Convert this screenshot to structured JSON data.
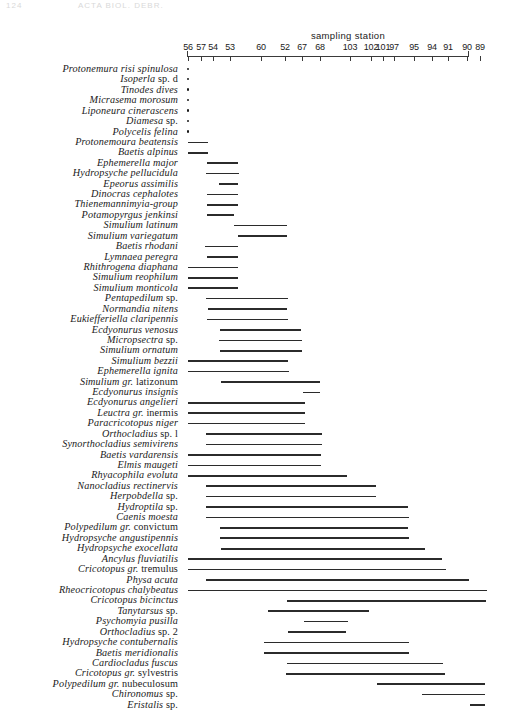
{
  "page_header": {
    "number": "124",
    "title": "ACTA BIOL. DEBR."
  },
  "axis": {
    "title": "sampling station",
    "x_left_px": 187,
    "x_right_px": 468,
    "ticks": [
      {
        "label": "56",
        "x": 188
      },
      {
        "label": "57",
        "x": 201
      },
      {
        "label": "54",
        "x": 213
      },
      {
        "label": "53",
        "x": 230
      },
      {
        "label": "60",
        "x": 261
      },
      {
        "label": "52",
        "x": 285
      },
      {
        "label": "67",
        "x": 302
      },
      {
        "label": "68",
        "x": 320
      },
      {
        "label": "103",
        "x": 350
      },
      {
        "label": "102",
        "x": 371
      },
      {
        "label": "101",
        "x": 383
      },
      {
        "label": "97",
        "x": 394
      },
      {
        "label": "95",
        "x": 414
      },
      {
        "label": "94",
        "x": 432
      },
      {
        "label": "91",
        "x": 448
      },
      {
        "label": "90",
        "x": 467
      },
      {
        "label": "89",
        "x": 480
      }
    ]
  },
  "chart_data": {
    "type": "bar",
    "title": "sampling station",
    "xlabel": "sampling station",
    "ylabel": "",
    "grid": false,
    "legend": false,
    "note": "Horizontal range bars: each taxon occupies a contiguous span of sampling stations ordered along the x-axis. A dot marks a single-station occurrence.",
    "x_tick_labels": [
      "56",
      "57",
      "54",
      "53",
      "60",
      "52",
      "67",
      "68",
      "103",
      "102",
      "101",
      "97",
      "95",
      "94",
      "91",
      "90",
      "89"
    ],
    "categories": [
      "Protonemura risi spinulosa",
      "Isoperla sp. d",
      "Tinodes dives",
      "Micrasema morosum",
      "Liponeura cinerascens",
      "Diamesa sp.",
      "Polycelis felina",
      "Protonemoura beatensis",
      "Baetis alpinus",
      "Ephemerella major",
      "Hydropsyche pellucidula",
      "Epeorus assimilis",
      "Dinocras cephalotes",
      "Thienemannimyia-group",
      "Potamopyrgus jenkinsi",
      "Simulium latinum",
      "Simulium variegatum",
      "Baetis rhodani",
      "Lymnaea peregra",
      "Rhithrogena diaphana",
      "Simulium reophilum",
      "Simulium monticola",
      "Pentapedilum sp.",
      "Normandia nitens",
      "Eukiefferiella claripennis",
      "Ecdyonurus venosus",
      "Micropsectra sp.",
      "Simulium ornatum",
      "Simulium bezzii",
      "Ephemerella ignita",
      "Simulium gr. latizonum",
      "Ecdyonurus insignis",
      "Ecdyonurus angelieri",
      "Leuctra gr. inermis",
      "Paracricotopus niger",
      "Orthocladius sp. l",
      "Synorthocladius semivirens",
      "Baetis vardarensis",
      "Elmis maugeti",
      "Rhyacophila evoluta",
      "Nanocladius rectinervis",
      "Herpobdella sp.",
      "Hydroptila sp.",
      "Caenis moesta",
      "Polypedilum gr. convictum",
      "Hydropsyche angustipennis",
      "Hydropsyche exocellata",
      "Ancylus fluviatilis",
      "Cricotopus gr. tremulus",
      "Physa acuta",
      "Rheocricotopus chalybeatus",
      "Cricotopus bicinctus",
      "Tanytarsus sp.",
      "Psychomyia pusilla",
      "Orthocladius sp. 2",
      "Hydropsyche contubernalis",
      "Baetis meridionalis",
      "Cardiocladus fuscus",
      "Cricotopus gr. sylvestris",
      "Polypedilum gr. nubeculosum",
      "Chironomus sp.",
      "Eristalis sp."
    ],
    "ranges_px": [
      [
        188,
        188
      ],
      [
        188,
        188
      ],
      [
        188,
        188
      ],
      [
        188,
        188
      ],
      [
        188,
        188
      ],
      [
        188,
        188
      ],
      [
        188,
        188
      ],
      [
        188,
        208
      ],
      [
        188,
        208
      ],
      [
        207,
        238
      ],
      [
        206,
        239
      ],
      [
        207,
        238
      ],
      [
        207,
        234
      ],
      [
        234,
        287
      ],
      [
        238,
        287
      ],
      [
        205,
        238
      ],
      [
        207,
        238
      ],
      [
        188,
        238
      ],
      [
        188,
        238
      ],
      [
        188,
        238
      ],
      [
        206,
        288
      ],
      [
        208,
        287
      ],
      [
        207,
        288
      ],
      [
        220,
        301
      ],
      [
        219,
        302
      ],
      [
        220,
        302
      ],
      [
        188,
        288
      ],
      [
        188,
        289
      ],
      [
        221,
        320
      ],
      [
        303,
        320
      ],
      [
        188,
        305
      ],
      [
        188,
        305
      ],
      [
        188,
        305
      ],
      [
        206,
        322
      ],
      [
        206,
        322
      ],
      [
        188,
        321
      ],
      [
        188,
        321
      ],
      [
        188,
        347
      ],
      [
        206,
        376
      ],
      [
        206,
        376
      ],
      [
        206,
        408
      ],
      [
        206,
        409
      ],
      [
        220,
        408
      ],
      [
        220,
        409
      ],
      [
        221,
        425
      ],
      [
        188,
        442
      ],
      [
        188,
        446
      ],
      [
        206,
        469
      ],
      [
        188,
        487
      ],
      [
        287,
        486
      ],
      [
        268,
        369
      ],
      [
        304,
        348
      ],
      [
        288,
        346
      ],
      [
        264,
        409
      ],
      [
        264,
        409
      ],
      [
        287,
        443
      ],
      [
        286,
        445
      ],
      [
        377,
        485
      ],
      [
        422,
        485
      ],
      [
        470,
        485
      ]
    ]
  },
  "species": [
    {
      "name": "Protonemura risi spinulosa",
      "normal": "",
      "mark": "dot",
      "x1": 188,
      "x2": 188
    },
    {
      "name": "Isoperla",
      "normal": "sp. d",
      "mark": "dot",
      "x1": 188,
      "x2": 188
    },
    {
      "name": "Tinodes dives",
      "normal": "",
      "mark": "dot",
      "x1": 188,
      "x2": 188
    },
    {
      "name": "Micrasema morosum",
      "normal": "",
      "mark": "dot",
      "x1": 188,
      "x2": 188
    },
    {
      "name": "Liponeura cinerascens",
      "normal": "",
      "mark": "dot",
      "x1": 188,
      "x2": 188
    },
    {
      "name": "Diamesa",
      "normal": "sp.",
      "mark": "dot",
      "x1": 188,
      "x2": 188
    },
    {
      "name": "Polycelis felina",
      "normal": "",
      "mark": "dot",
      "x1": 188,
      "x2": 188
    },
    {
      "name": "Protonemoura beatensis",
      "normal": "",
      "mark": "bar",
      "x1": 188,
      "x2": 208
    },
    {
      "name": "Baetis alpinus",
      "normal": "",
      "mark": "bar",
      "x1": 188,
      "x2": 208
    },
    {
      "name": "Ephemerella major",
      "normal": "",
      "mark": "bar",
      "x1": 207,
      "x2": 238
    },
    {
      "name": "Hydropsyche pellucidula",
      "normal": "",
      "mark": "bar",
      "x1": 206,
      "x2": 239
    },
    {
      "name": "Epeorus assimilis",
      "normal": "",
      "mark": "bar",
      "x1": 219,
      "x2": 238
    },
    {
      "name": "Dinocras cephalotes",
      "normal": "",
      "mark": "bar",
      "x1": 207,
      "x2": 238
    },
    {
      "name": "Thienemannimyia-group",
      "normal": "",
      "mark": "bar",
      "x1": 207,
      "x2": 238
    },
    {
      "name": "Potamopyrgus jenkinsi",
      "normal": "",
      "mark": "bar",
      "x1": 207,
      "x2": 234
    },
    {
      "name": "Simulium latinum",
      "normal": "",
      "mark": "bar",
      "x1": 234,
      "x2": 287
    },
    {
      "name": "Simulium variegatum",
      "normal": "",
      "mark": "bar",
      "x1": 238,
      "x2": 287
    },
    {
      "name": "Baetis rhodani",
      "normal": "",
      "mark": "bar",
      "x1": 205,
      "x2": 238
    },
    {
      "name": "Lymnaea peregra",
      "normal": "",
      "mark": "bar",
      "x1": 207,
      "x2": 238
    },
    {
      "name": "Rhithrogena diaphana",
      "normal": "",
      "mark": "bar",
      "x1": 188,
      "x2": 238
    },
    {
      "name": "Simulium reophilum",
      "normal": "",
      "mark": "bar",
      "x1": 188,
      "x2": 238
    },
    {
      "name": "Simulium monticola",
      "normal": "",
      "mark": "bar",
      "x1": 188,
      "x2": 238
    },
    {
      "name": "Pentapedilum",
      "normal": "sp.",
      "mark": "bar",
      "x1": 206,
      "x2": 288
    },
    {
      "name": "Normandia nitens",
      "normal": "",
      "mark": "bar",
      "x1": 208,
      "x2": 287
    },
    {
      "name": "Eukiefferiella claripennis",
      "normal": "",
      "mark": "bar",
      "x1": 207,
      "x2": 288
    },
    {
      "name": "Ecdyonurus venosus",
      "normal": "",
      "mark": "bar",
      "x1": 220,
      "x2": 301
    },
    {
      "name": "Micropsectra",
      "normal": "sp.",
      "mark": "bar",
      "x1": 219,
      "x2": 302
    },
    {
      "name": "Simulium ornatum",
      "normal": "",
      "mark": "bar",
      "x1": 220,
      "x2": 302
    },
    {
      "name": "Simulium bezzii",
      "normal": "",
      "mark": "bar",
      "x1": 188,
      "x2": 288
    },
    {
      "name": "Ephemerella ignita",
      "normal": "",
      "mark": "bar",
      "x1": 188,
      "x2": 289
    },
    {
      "name": "Simulium gr.",
      "normal": "latizonum",
      "mark": "bar",
      "x1": 221,
      "x2": 320
    },
    {
      "name": "Ecdyonurus insignis",
      "normal": "",
      "mark": "bar",
      "x1": 303,
      "x2": 320
    },
    {
      "name": "Ecdyonurus angelieri",
      "normal": "",
      "mark": "bar",
      "x1": 188,
      "x2": 305
    },
    {
      "name": "Leuctra gr.",
      "normal": "inermis",
      "mark": "bar",
      "x1": 188,
      "x2": 305
    },
    {
      "name": "Paracricotopus niger",
      "normal": "",
      "mark": "bar",
      "x1": 188,
      "x2": 305
    },
    {
      "name": "Orthocladius",
      "normal": "sp. l",
      "mark": "bar",
      "x1": 206,
      "x2": 322
    },
    {
      "name": "Synorthocladius semivirens",
      "normal": "",
      "mark": "bar",
      "x1": 206,
      "x2": 322
    },
    {
      "name": "Baetis vardarensis",
      "normal": "",
      "mark": "bar",
      "x1": 188,
      "x2": 321
    },
    {
      "name": "Elmis maugeti",
      "normal": "",
      "mark": "bar",
      "x1": 188,
      "x2": 321
    },
    {
      "name": "Rhyacophila evoluta",
      "normal": "",
      "mark": "bar",
      "x1": 188,
      "x2": 347
    },
    {
      "name": "Nanocladius rectinervis",
      "normal": "",
      "mark": "bar",
      "x1": 206,
      "x2": 376
    },
    {
      "name": "Herpobdella",
      "normal": "sp.",
      "mark": "bar",
      "x1": 206,
      "x2": 376
    },
    {
      "name": "Hydroptila",
      "normal": "sp.",
      "mark": "bar",
      "x1": 206,
      "x2": 408
    },
    {
      "name": "Caenis moesta",
      "normal": "",
      "mark": "bar",
      "x1": 206,
      "x2": 409
    },
    {
      "name": "Polypedilum gr.",
      "normal": "convictum",
      "mark": "bar",
      "x1": 220,
      "x2": 408
    },
    {
      "name": "Hydropsyche angustipennis",
      "normal": "",
      "mark": "bar",
      "x1": 220,
      "x2": 409
    },
    {
      "name": "Hydropsyche exocellata",
      "normal": "",
      "mark": "bar",
      "x1": 221,
      "x2": 425
    },
    {
      "name": "Ancylus fluviatilis",
      "normal": "",
      "mark": "bar",
      "x1": 188,
      "x2": 442
    },
    {
      "name": "Cricotopus gr.",
      "normal": "tremulus",
      "mark": "bar",
      "x1": 188,
      "x2": 446
    },
    {
      "name": "Physa acuta",
      "normal": "",
      "mark": "bar",
      "x1": 206,
      "x2": 469
    },
    {
      "name": "Rheocricotopus chalybeatus",
      "normal": "",
      "mark": "bar",
      "x1": 188,
      "x2": 487
    },
    {
      "name": "Cricotopus bicinctus",
      "normal": "",
      "mark": "bar",
      "x1": 287,
      "x2": 486
    },
    {
      "name": "Tanytarsus",
      "normal": "sp.",
      "mark": "bar",
      "x1": 268,
      "x2": 369
    },
    {
      "name": "Psychomyia pusilla",
      "normal": "",
      "mark": "bar",
      "x1": 304,
      "x2": 348
    },
    {
      "name": "Orthocladius",
      "normal": "sp. 2",
      "mark": "bar",
      "x1": 288,
      "x2": 346
    },
    {
      "name": "Hydropsyche contubernalis",
      "normal": "",
      "mark": "bar",
      "x1": 264,
      "x2": 409
    },
    {
      "name": "Baetis meridionalis",
      "normal": "",
      "mark": "bar",
      "x1": 264,
      "x2": 409
    },
    {
      "name": "Cardiocladus fuscus",
      "normal": "",
      "mark": "bar",
      "x1": 287,
      "x2": 443
    },
    {
      "name": "Cricotopus gr.",
      "normal": "sylvestris",
      "mark": "bar",
      "x1": 286,
      "x2": 445
    },
    {
      "name": "Polypedilum gr.",
      "normal": "nubeculosum",
      "mark": "bar",
      "x1": 377,
      "x2": 485
    },
    {
      "name": "Chironomus",
      "normal": "sp.",
      "mark": "bar",
      "x1": 422,
      "x2": 485
    },
    {
      "name": "Eristalis",
      "normal": "sp.",
      "mark": "bar",
      "x1": 470,
      "x2": 485
    }
  ],
  "layout": {
    "first_row_top": 62,
    "row_height": 10.42
  }
}
